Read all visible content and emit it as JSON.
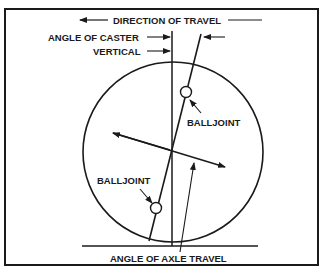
{
  "diagram": {
    "labels": {
      "direction_of_travel": "DIRECTION OF TRAVEL",
      "angle_of_caster": "ANGLE OF CASTER",
      "vertical": "VERTICAL",
      "balljoint_upper": "BALLJOINT",
      "balljoint_lower": "BALLJOINT",
      "angle_of_axle_travel": "ANGLE OF AXLE TRAVEL"
    },
    "colors": {
      "ink": "#1a1a1a",
      "background": "#ffffff"
    }
  }
}
